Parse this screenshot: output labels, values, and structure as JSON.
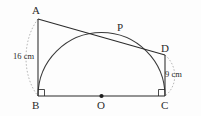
{
  "figure": {
    "background_color": "#fdfdfd",
    "stroke_color": "#2b2b2b",
    "dash_color": "#9a9a9a",
    "vertices": {
      "A": {
        "label": "A",
        "x": 38,
        "y": 19
      },
      "B": {
        "label": "B",
        "x": 38,
        "y": 96
      },
      "C": {
        "label": "C",
        "x": 165,
        "y": 96
      },
      "D": {
        "label": "D",
        "x": 165,
        "y": 55
      },
      "O": {
        "label": "O",
        "x": 101.5,
        "y": 96
      },
      "P": {
        "label": "P",
        "x": 113,
        "y": 33
      }
    },
    "measurements": {
      "AB": {
        "label": "16 cm",
        "value": 16,
        "unit": "cm"
      },
      "DC": {
        "label": "9 cm",
        "value": 9,
        "unit": "cm"
      }
    },
    "semicircle": {
      "center_x": 101.5,
      "center_y": 96,
      "radius": 63.5
    },
    "right_angles": [
      "B",
      "C"
    ],
    "center_dot": {
      "x": 101.5,
      "y": 96,
      "radius": 2.1
    }
  }
}
